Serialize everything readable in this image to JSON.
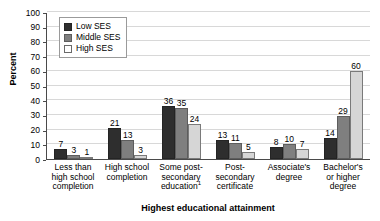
{
  "chart_data": {
    "type": "bar",
    "title": "",
    "xlabel": "Highest educational attainment",
    "ylabel": "Percent",
    "ylim": [
      0,
      100
    ],
    "yticks": [
      0,
      10,
      20,
      30,
      40,
      50,
      60,
      70,
      80,
      90,
      100
    ],
    "grid": true,
    "legend_position": "top-left-inside",
    "categories": [
      "Less than high school completion",
      "High school completion",
      "Some post-secondary education¹",
      "Post-secondary certificate",
      "Associate's degree",
      "Bachelor's or higher degree"
    ],
    "category_lines": [
      [
        "Less than",
        "high school",
        "completion"
      ],
      [
        "High school",
        "completion"
      ],
      [
        "Some post-",
        "secondary",
        "education"
      ],
      [
        "Post-",
        "secondary",
        "certificate"
      ],
      [
        "Associate's",
        "degree"
      ],
      [
        "Bachelor's",
        "or higher",
        "degree"
      ]
    ],
    "footnote_marker": "1",
    "series": [
      {
        "name": "Low SES",
        "color": "#2e2e2e",
        "values": [
          7,
          21,
          36,
          13,
          8,
          14
        ]
      },
      {
        "name": "Middle SES",
        "color": "#7f7f7f",
        "values": [
          3,
          13,
          35,
          11,
          10,
          29
        ]
      },
      {
        "name": "High SES",
        "color": "#d6d6d6",
        "values": [
          1,
          3,
          24,
          5,
          7,
          60
        ]
      }
    ]
  },
  "legend": {
    "items": [
      {
        "label": "Low SES"
      },
      {
        "label": "Middle SES"
      },
      {
        "label": "High SES"
      }
    ]
  }
}
